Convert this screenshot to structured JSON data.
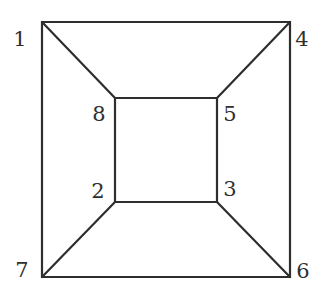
{
  "figure": {
    "kind": "line-diagram",
    "background_color": "#ffffff",
    "stroke_color": "#2e2e2d",
    "label_color": "#30302f",
    "stroke_width": 2.2,
    "canvas": {
      "width": 325,
      "height": 300
    },
    "outer_square": {
      "name": "outer-square",
      "corners": {
        "top_left": {
          "x": 42,
          "y": 22
        },
        "top_right": {
          "x": 290,
          "y": 22
        },
        "bottom_right": {
          "x": 290,
          "y": 277
        },
        "bottom_left": {
          "x": 42,
          "y": 277
        }
      }
    },
    "inner_square": {
      "name": "inner-square",
      "corners": {
        "top_left": {
          "x": 115,
          "y": 98
        },
        "top_right": {
          "x": 217,
          "y": 98
        },
        "bottom_right": {
          "x": 217,
          "y": 202
        },
        "bottom_left": {
          "x": 115,
          "y": 202
        }
      }
    },
    "diagonals": [
      {
        "name": "diagonal-1-8",
        "from": "1",
        "to": "8",
        "x1": 42,
        "y1": 22,
        "x2": 115,
        "y2": 98
      },
      {
        "name": "diagonal-4-5",
        "from": "4",
        "to": "5",
        "x1": 290,
        "y1": 22,
        "x2": 217,
        "y2": 98
      },
      {
        "name": "diagonal-6-3",
        "from": "6",
        "to": "3",
        "x1": 290,
        "y1": 277,
        "x2": 217,
        "y2": 202
      },
      {
        "name": "diagonal-7-2",
        "from": "7",
        "to": "2",
        "x1": 42,
        "y1": 277,
        "x2": 115,
        "y2": 202
      }
    ],
    "vertex_labels": [
      {
        "id": "1",
        "text": "1",
        "x": 20,
        "y": 39,
        "position": "outer-top-left"
      },
      {
        "id": "4",
        "text": "4",
        "x": 302,
        "y": 39,
        "position": "outer-top-right"
      },
      {
        "id": "8",
        "text": "8",
        "x": 99,
        "y": 114,
        "position": "inner-top-left"
      },
      {
        "id": "5",
        "text": "5",
        "x": 230,
        "y": 114,
        "position": "inner-top-right"
      },
      {
        "id": "2",
        "text": "2",
        "x": 98,
        "y": 191,
        "position": "inner-bottom-left"
      },
      {
        "id": "3",
        "text": "3",
        "x": 230,
        "y": 189,
        "position": "inner-bottom-right"
      },
      {
        "id": "7",
        "text": "7",
        "x": 22,
        "y": 270,
        "position": "outer-bottom-left"
      },
      {
        "id": "6",
        "text": "6",
        "x": 303,
        "y": 271,
        "position": "outer-bottom-right"
      }
    ]
  }
}
